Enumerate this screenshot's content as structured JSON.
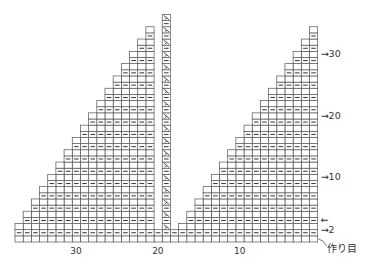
{
  "diagram": {
    "type": "knitting-chart",
    "total_stitches": 37,
    "total_rows": 36,
    "center_stitch": 19,
    "grid": {
      "left": 15,
      "bottom": 242,
      "cell_w": 8.18,
      "cell_h": 6.15
    },
    "colors": {
      "line": "#555555",
      "symbol": "#333333",
      "background": "#ffffff"
    },
    "symbols": {
      "purl": "—",
      "center_decrease": "slanted-decrease"
    },
    "x_axis_labels": [
      {
        "text": "30",
        "stitch": 30
      },
      {
        "text": "20",
        "stitch": 20
      },
      {
        "text": "10",
        "stitch": 10
      }
    ],
    "row_labels": [
      {
        "text": "→30",
        "row": 30
      },
      {
        "text": "→20",
        "row": 20
      },
      {
        "text": "→10",
        "row": 10
      },
      {
        "text": "←",
        "row": 3
      },
      {
        "text": "→2",
        "row": 1.5
      }
    ],
    "cast_on_label": "作り目"
  }
}
